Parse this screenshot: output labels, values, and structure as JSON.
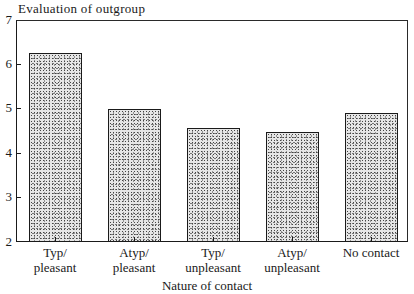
{
  "chart_data": {
    "type": "bar",
    "title": "Evaluation of outgroup",
    "xlabel": "Nature of contact",
    "ylabel": "Evaluation of outgroup",
    "categories": [
      "Typ/\npleasant",
      "Atyp/\npleasant",
      "Typ/\nunpleasant",
      "Atyp/\nunpleasant",
      "No contact"
    ],
    "category_lines": [
      [
        "Typ/",
        "pleasant"
      ],
      [
        "Atyp/",
        "pleasant"
      ],
      [
        "Typ/",
        "unpleasant"
      ],
      [
        "Atyp/",
        "unpleasant"
      ],
      [
        "No contact",
        ""
      ]
    ],
    "values": [
      6.25,
      5.0,
      4.57,
      4.48,
      4.9
    ],
    "ylim": [
      2,
      7
    ],
    "yticks": [
      "7",
      "6",
      "5",
      "4",
      "3",
      "2"
    ],
    "grid": false,
    "legend": null,
    "bar_fill": "stippled grey"
  }
}
